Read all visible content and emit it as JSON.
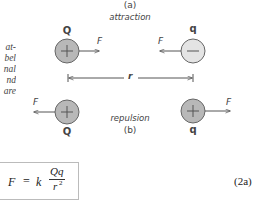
{
  "side_text": [
    "at-",
    "bel",
    "nal",
    "nd",
    "are"
  ],
  "panel_a": {
    "label": "(a)",
    "caption": "attraction",
    "left_charge": {
      "name": "Q",
      "sign": "+",
      "fill": "#b8b8b8"
    },
    "right_charge": {
      "name": "q",
      "sign": "−",
      "fill": "#e4e4e4"
    },
    "left_force": "F",
    "right_force": "F"
  },
  "distance_label": "r",
  "panel_b": {
    "label": "(b)",
    "caption": "repulsion",
    "left_charge": {
      "name": "Q",
      "sign": "+",
      "fill": "#b8b8b8"
    },
    "right_charge": {
      "name": "q",
      "sign": "+",
      "fill": "#b8b8b8"
    },
    "left_force": "F",
    "right_force": "F"
  },
  "equation": {
    "lhs": "F",
    "equals": "=",
    "constant": "k",
    "numerator": "Qq",
    "denominator": "r",
    "exponent": "2",
    "number": "(2a)"
  },
  "colors": {
    "stroke": "#555555",
    "text": "#333333"
  }
}
